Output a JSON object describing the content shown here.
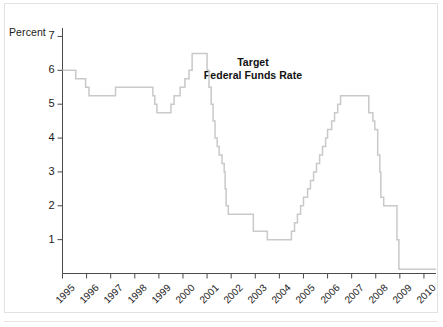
{
  "figure": {
    "background_color": "#ffffff",
    "border_color": "#e2e2e2"
  },
  "annotation": {
    "line1": "Target",
    "line2": "Federal Funds Rate"
  },
  "axis": {
    "y_axis_title": "Percent",
    "y_tick_labels": [
      "7",
      "6",
      "5",
      "4",
      "3",
      "2",
      "1"
    ],
    "x_tick_labels": [
      "1995",
      "1996",
      "1997",
      "1998",
      "1999",
      "2000",
      "2001",
      "2002",
      "2003",
      "2004",
      "2005",
      "2006",
      "2007",
      "2008",
      "2009",
      "2010"
    ]
  },
  "chart_data": {
    "type": "line",
    "interpolation": "step-after",
    "title": "Target Federal Funds Rate",
    "subtitle": "",
    "xlabel": "",
    "ylabel": "Percent",
    "xlim": [
      1995.0,
      2010.5
    ],
    "ylim": [
      0,
      7.25
    ],
    "grid": false,
    "legend": "none",
    "line_color": "#c9c9c9",
    "line_width": 1.5,
    "y_ticks": [
      1,
      2,
      3,
      4,
      5,
      6,
      7
    ],
    "x_ticks": [
      1995,
      1996,
      1997,
      1998,
      1999,
      2000,
      2001,
      2002,
      2003,
      2004,
      2005,
      2006,
      2007,
      2008,
      2009,
      2010
    ],
    "series": [
      {
        "name": "Target Federal Funds Rate",
        "units": "percent",
        "points": [
          {
            "x": 1995.0,
            "y": 6.0
          },
          {
            "x": 1995.55,
            "y": 5.75
          },
          {
            "x": 1995.96,
            "y": 5.5
          },
          {
            "x": 1996.1,
            "y": 5.25
          },
          {
            "x": 1997.2,
            "y": 5.5
          },
          {
            "x": 1998.75,
            "y": 5.25
          },
          {
            "x": 1998.83,
            "y": 5.0
          },
          {
            "x": 1998.92,
            "y": 4.75
          },
          {
            "x": 1999.5,
            "y": 5.0
          },
          {
            "x": 1999.63,
            "y": 5.25
          },
          {
            "x": 1999.88,
            "y": 5.5
          },
          {
            "x": 2000.08,
            "y": 5.75
          },
          {
            "x": 2000.25,
            "y": 6.0
          },
          {
            "x": 2000.38,
            "y": 6.5
          },
          {
            "x": 2001.0,
            "y": 6.0
          },
          {
            "x": 2001.08,
            "y": 5.5
          },
          {
            "x": 2001.17,
            "y": 5.0
          },
          {
            "x": 2001.25,
            "y": 4.5
          },
          {
            "x": 2001.33,
            "y": 4.0
          },
          {
            "x": 2001.42,
            "y": 3.75
          },
          {
            "x": 2001.5,
            "y": 3.5
          },
          {
            "x": 2001.62,
            "y": 3.25
          },
          {
            "x": 2001.71,
            "y": 3.0
          },
          {
            "x": 2001.75,
            "y": 2.5
          },
          {
            "x": 2001.79,
            "y": 2.0
          },
          {
            "x": 2001.88,
            "y": 1.75
          },
          {
            "x": 2002.92,
            "y": 1.25
          },
          {
            "x": 2003.5,
            "y": 1.0
          },
          {
            "x": 2004.5,
            "y": 1.25
          },
          {
            "x": 2004.63,
            "y": 1.5
          },
          {
            "x": 2004.75,
            "y": 1.75
          },
          {
            "x": 2004.88,
            "y": 2.0
          },
          {
            "x": 2005.0,
            "y": 2.25
          },
          {
            "x": 2005.17,
            "y": 2.5
          },
          {
            "x": 2005.29,
            "y": 2.75
          },
          {
            "x": 2005.42,
            "y": 3.0
          },
          {
            "x": 2005.54,
            "y": 3.25
          },
          {
            "x": 2005.67,
            "y": 3.5
          },
          {
            "x": 2005.79,
            "y": 3.75
          },
          {
            "x": 2005.92,
            "y": 4.0
          },
          {
            "x": 2006.0,
            "y": 4.25
          },
          {
            "x": 2006.17,
            "y": 4.5
          },
          {
            "x": 2006.29,
            "y": 4.75
          },
          {
            "x": 2006.42,
            "y": 5.0
          },
          {
            "x": 2006.54,
            "y": 5.25
          },
          {
            "x": 2007.71,
            "y": 4.75
          },
          {
            "x": 2007.88,
            "y": 4.5
          },
          {
            "x": 2007.96,
            "y": 4.25
          },
          {
            "x": 2008.08,
            "y": 3.5
          },
          {
            "x": 2008.17,
            "y": 3.0
          },
          {
            "x": 2008.21,
            "y": 2.25
          },
          {
            "x": 2008.33,
            "y": 2.0
          },
          {
            "x": 2008.88,
            "y": 1.0
          },
          {
            "x": 2008.96,
            "y": 0.125
          },
          {
            "x": 2010.5,
            "y": 0.125
          }
        ]
      }
    ]
  }
}
